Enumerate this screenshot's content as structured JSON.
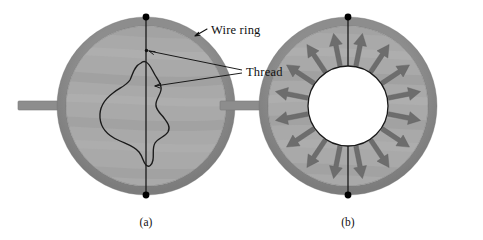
{
  "figure": {
    "background_color": "#ffffff",
    "labels": {
      "wire_ring": "Wire ring",
      "thread": "Thread"
    },
    "captions": {
      "panel_a": "(a)",
      "panel_b": "(b)"
    }
  },
  "colors": {
    "ring": "#8d8d8d",
    "ring_shadow": "#7b7b7b",
    "film": "#a9a9a9",
    "film_streak": "#9b9b9b",
    "film_streak_light": "#b4b4b4",
    "handle": "#8d8d8d",
    "thread_line": "#1a1a1a",
    "dot": "#000000",
    "arrow": "#6d6d6d",
    "hole": "#ffffff",
    "text": "#111111",
    "leader": "#111111"
  },
  "panel_a": {
    "name": "wire-ring-with-slack-thread-loop",
    "center": {
      "x": 146,
      "y": 106
    },
    "outer_radius": 89,
    "ring_thickness": 9,
    "handle": {
      "x": 18,
      "y": 101,
      "width": 44,
      "height": 9
    },
    "vertical_thread": {
      "x": 146,
      "y_top": 17,
      "y_bottom": 195
    },
    "dots": [
      {
        "x": 146,
        "y": 17,
        "r": 3.4
      },
      {
        "x": 146,
        "y": 195,
        "r": 3.4
      }
    ],
    "loop_description": "irregular slack closed thread loop resting in the soap film",
    "loop_path": "M 141 63 C 134 66 133 74 130 80 C 126 86 119 88 113 93 C 105 99 99 107 100 118 C 101 129 109 136 118 140 C 126 144 134 146 139 152 C 143 157 143 162 146 165 C 149 168 152 165 153 160 C 154 154 152 148 155 143 C 158 138 165 137 168 132 C 171 127 167 122 164 118 C 161 114 157 111 156 106 C 155 100 160 96 161 90 C 162 84 158 80 155 75 C 152 70 150 64 146 62 C 144 61 142 62 141 63 Z"
  },
  "panel_b": {
    "name": "wire-ring-with-circular-thread-and-force-arrows",
    "center": {
      "x": 348,
      "y": 106
    },
    "outer_radius": 89,
    "ring_thickness": 9,
    "handle": {
      "x": 220,
      "y": 101,
      "width": 44,
      "height": 9
    },
    "hole_radius": 40,
    "vertical_thread": {
      "x": 348,
      "y_top": 17,
      "y_bottom": 195
    },
    "dots": [
      {
        "x": 348,
        "y": 17,
        "r": 3.4
      },
      {
        "x": 348,
        "y": 195,
        "r": 3.4
      }
    ],
    "arrow_count": 16,
    "arrow_inner_radius": 41,
    "arrow_outer_radius": 74,
    "arrow_shaft_width": 4.6,
    "arrow_head_width": 13,
    "arrow_head_length": 12,
    "arrow_angles_deg": [
      11.25,
      33.75,
      56.25,
      78.75,
      101.25,
      123.75,
      146.25,
      168.75,
      191.25,
      213.75,
      236.25,
      258.75,
      281.25,
      303.75,
      326.25,
      348.75
    ],
    "meaning": "surface tension of the soap film pulls the thread radially outward in all directions"
  },
  "annotations": {
    "wire_ring_label": {
      "text_x": 210,
      "text_y": 32,
      "arrow_from": {
        "x": 208,
        "y": 30
      },
      "arrow_to": {
        "x": 196,
        "y": 36
      }
    },
    "thread_label": {
      "text_x": 246,
      "text_y": 75,
      "leaders": [
        {
          "x1": 243,
          "y1": 71,
          "x2": 147,
          "y2": 51
        },
        {
          "x1": 243,
          "y1": 73,
          "x2": 153,
          "y2": 85
        }
      ]
    },
    "caption_a": {
      "x": 146,
      "y": 224
    },
    "caption_b": {
      "x": 348,
      "y": 224
    }
  }
}
